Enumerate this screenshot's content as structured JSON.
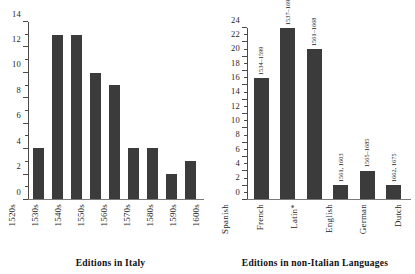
{
  "figure": {
    "panels": [
      {
        "caption": "Editions in Italy",
        "chart_data": {
          "type": "bar",
          "title": "Editions in Italy",
          "xlabel": "",
          "ylabel": "",
          "ylim": [
            0,
            14
          ],
          "ytick_step": 2,
          "yticks": [
            "0",
            "2",
            "4",
            "6",
            "8",
            "10",
            "12",
            "14"
          ],
          "minor_ticks": true,
          "grid": false,
          "legend": "none",
          "bar_color": "#3b3b3b",
          "categories": [
            "1520s",
            "1530s",
            "1540s",
            "1550s",
            "1560s",
            "1570s",
            "1580s",
            "1590s",
            "1600s"
          ],
          "values": [
            4,
            13,
            13,
            10,
            9,
            4,
            4,
            2,
            3
          ],
          "annotations": [
            "",
            "",
            "",
            "",
            "",
            "",
            "",
            "",
            ""
          ]
        }
      },
      {
        "caption": "Editions in non-Italian Languages",
        "chart_data": {
          "type": "bar",
          "title": "Editions in non-Italian Languages",
          "xlabel": "",
          "ylabel": "",
          "ylim": [
            0,
            24
          ],
          "ytick_step": 2,
          "yticks": [
            "0",
            "2",
            "4",
            "6",
            "8",
            "10",
            "12",
            "14",
            "16",
            "18",
            "20",
            "22",
            "24"
          ],
          "minor_ticks": true,
          "grid": false,
          "legend": "none",
          "bar_color": "#3b3b3b",
          "categories": [
            "Spanish",
            "French",
            "Latin*",
            "English",
            "German",
            "Dutch"
          ],
          "values": [
            17,
            24,
            21,
            2,
            4,
            2
          ],
          "annotations": [
            "1534–1599",
            "1537–1690",
            "1561–1668",
            "1561, 1603",
            "1565–1685",
            "1662, 1675"
          ]
        }
      }
    ]
  }
}
